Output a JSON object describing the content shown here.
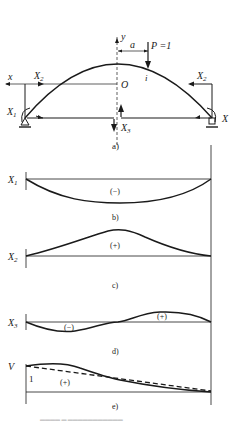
{
  "figure": {
    "panel_a": {
      "caption": "a)",
      "axis_x": "x",
      "axis_y": "y",
      "origin": "O",
      "dimension_a": "a",
      "load": "P =1",
      "load_point": "i",
      "force_X1": "X",
      "force_X1_sub": "1",
      "force_X1_right": "X",
      "force_X2_left": "X",
      "force_X2_left_sub": "2",
      "force_X2_right": "X",
      "force_X2_right_sub": "2",
      "force_X3": "X",
      "force_X3_sub": "3"
    },
    "panel_b": {
      "caption": "b)",
      "label": "X",
      "label_sub": "1",
      "sign": "(−)"
    },
    "panel_c": {
      "caption": "c)",
      "label": "X",
      "label_sub": "2",
      "sign": "(+)"
    },
    "panel_d": {
      "caption": "d)",
      "label": "X",
      "label_sub": "3",
      "sign_neg": "(−)",
      "sign_pos": "(+)"
    },
    "panel_e": {
      "caption": "e)",
      "label": "V",
      "unit_value": "1",
      "sign": "(+)"
    },
    "bottom_caption": "▬▬▬▬  ▬  ▬▬▬▬▬▬▬▬▬▬▬"
  }
}
